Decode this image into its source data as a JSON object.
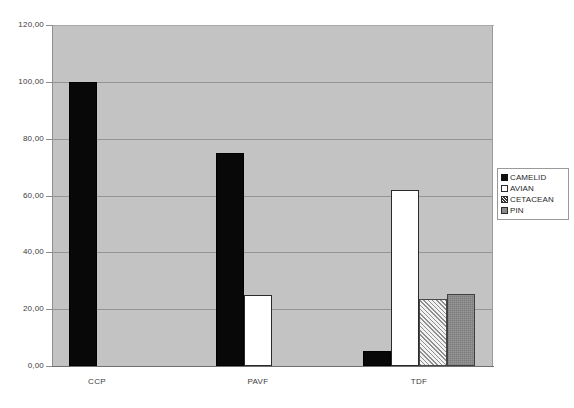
{
  "chart_data": {
    "type": "bar",
    "title": "",
    "subtitle": "",
    "xlabel": "",
    "ylabel": "",
    "categories": [
      "CCP",
      "PAVF",
      "TDF"
    ],
    "series": [
      {
        "name": "CAMELID",
        "color": "#080808",
        "fill": "solid-black",
        "values": [
          100.0,
          75.0,
          5.3
        ]
      },
      {
        "name": "AVIAN",
        "color": "#ffffff",
        "fill": "solid-white",
        "values": [
          null,
          25.0,
          62.0
        ]
      },
      {
        "name": "CETACEAN",
        "color": "#f2f2f2",
        "fill": "diagonal-hatch",
        "values": [
          null,
          null,
          23.5
        ]
      },
      {
        "name": "PIN",
        "color": "#8e8e8e",
        "fill": "solid-gray",
        "values": [
          null,
          null,
          25.5
        ]
      }
    ],
    "ylim": [
      0,
      120
    ],
    "yticks": [
      0,
      20,
      40,
      60,
      80,
      100,
      120
    ],
    "ytick_labels": [
      "0,00",
      "20,00",
      "40,00",
      "60,00",
      "80,00",
      "100,00",
      "120,00"
    ],
    "grid": true,
    "grid_axis": "y",
    "legend_position": "right",
    "plot_background": "#c3c3c3",
    "figure_background": "#ffffff"
  },
  "legend": {
    "items": [
      {
        "label": "CAMELID"
      },
      {
        "label": "AVIAN"
      },
      {
        "label": "CETACEAN"
      },
      {
        "label": "PIN"
      }
    ]
  }
}
